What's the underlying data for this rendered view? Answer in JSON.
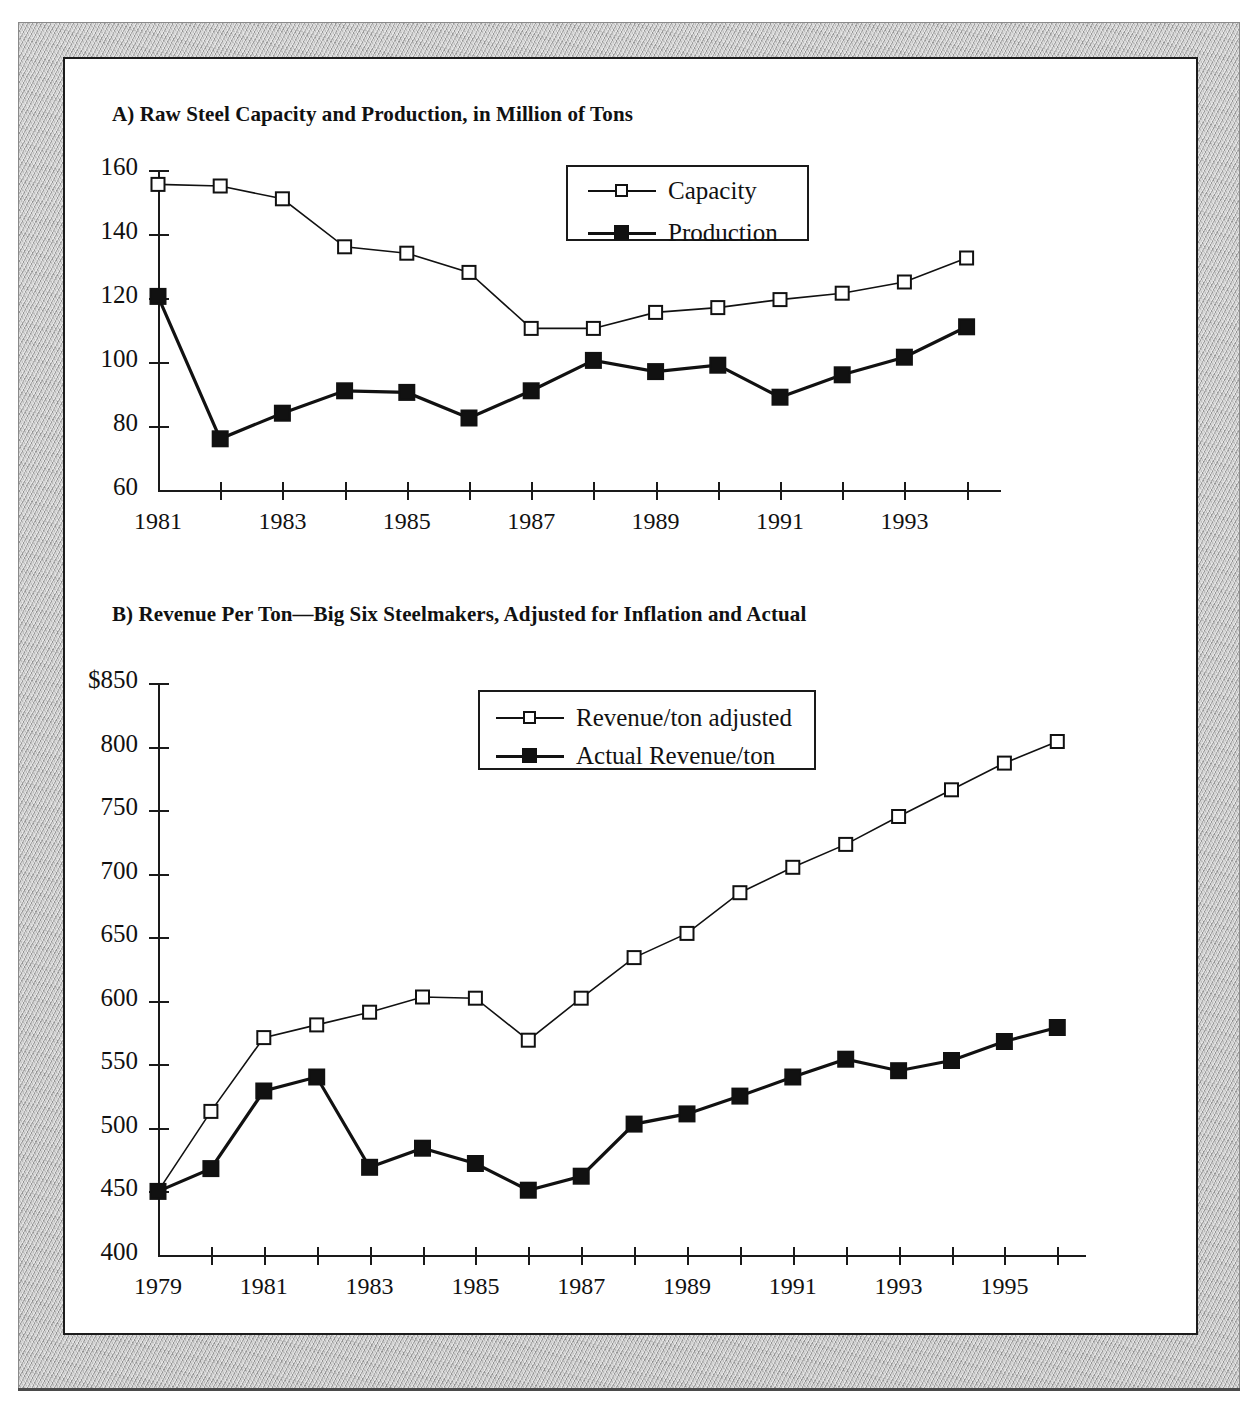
{
  "figure": {
    "background_color": "#ffffff",
    "frame_color": "#b5b5b5",
    "line_color": "#1a1a1a"
  },
  "chart_data": [
    {
      "id": "A",
      "type": "line",
      "title": "A) Raw Steel Capacity and Production, in Million of Tons",
      "xlabel": "",
      "ylabel": "",
      "ylim": [
        60,
        160
      ],
      "yticks": [
        60,
        80,
        100,
        120,
        140,
        160
      ],
      "ytick_labels": [
        "60",
        "80",
        "100",
        "120",
        "140",
        "160"
      ],
      "grid": false,
      "legend_position": "top-right",
      "x": [
        1981,
        1982,
        1983,
        1984,
        1985,
        1986,
        1987,
        1988,
        1989,
        1990,
        1991,
        1992,
        1993,
        1994
      ],
      "xtick_labels": [
        "1981",
        "",
        "1983",
        "",
        "1985",
        "",
        "1987",
        "",
        "1989",
        "",
        "1991",
        "",
        "1993",
        ""
      ],
      "series": [
        {
          "name": "Capacity",
          "marker": "open-square",
          "values": [
            155.5,
            155,
            151,
            136,
            134,
            128,
            110.5,
            110.5,
            115.5,
            117,
            119.5,
            121.5,
            125,
            132.5
          ]
        },
        {
          "name": "Production",
          "marker": "filled-square",
          "values": [
            120.5,
            76,
            84,
            91,
            90.5,
            82.5,
            91,
            100.5,
            97,
            99,
            89,
            96,
            101.5,
            111
          ]
        }
      ]
    },
    {
      "id": "B",
      "type": "line",
      "title": "B) Revenue Per Ton—Big Six Steelmakers, Adjusted for Inflation and Actual",
      "xlabel": "",
      "ylabel": "",
      "ylim": [
        400,
        850
      ],
      "yticks": [
        400,
        450,
        500,
        550,
        600,
        650,
        700,
        750,
        800,
        850
      ],
      "ytick_labels": [
        "400",
        "450",
        "500",
        "550",
        "600",
        "650",
        "700",
        "750",
        "800",
        "$850"
      ],
      "grid": false,
      "legend_position": "top-center",
      "x": [
        1979,
        1980,
        1981,
        1982,
        1983,
        1984,
        1985,
        1986,
        1987,
        1988,
        1989,
        1990,
        1991,
        1992,
        1993,
        1994,
        1995,
        1996
      ],
      "xtick_labels": [
        "1979",
        "",
        "1981",
        "",
        "1983",
        "",
        "1985",
        "",
        "1987",
        "",
        "1989",
        "",
        "1991",
        "",
        "1993",
        "",
        "1995",
        ""
      ],
      "series": [
        {
          "name": "Revenue/ton adjusted",
          "marker": "open-square",
          "values": [
            450,
            513,
            571,
            581,
            591,
            603,
            602,
            569,
            602,
            634,
            653,
            685,
            705,
            723,
            745,
            766,
            787,
            804
          ]
        },
        {
          "name": "Actual Revenue/ton",
          "marker": "filled-square",
          "values": [
            450,
            468,
            529,
            540,
            469,
            484,
            472,
            451,
            462,
            503,
            511,
            525,
            540,
            554,
            545,
            553,
            568,
            579
          ]
        }
      ]
    }
  ]
}
